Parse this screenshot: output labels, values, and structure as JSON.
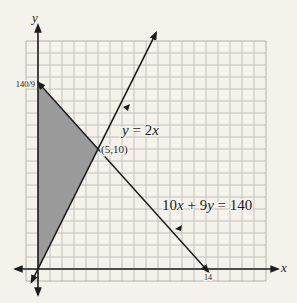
{
  "colors": {
    "background": "#f4f2ea",
    "grid": "#bcbcbc",
    "grid_border": "#a9a9a9",
    "axis": "#1c1c1c",
    "line": "#1c1c1c",
    "shade": "#9a9a9a"
  },
  "layout": {
    "origin_px": [
      38,
      269
    ],
    "unit_px": 12
  },
  "axes": {
    "x_label": "x",
    "y_label": "y"
  },
  "labels": {
    "y_intercept": "140/9",
    "intersection": "(5,10)",
    "x_intercept": "14",
    "line1": {
      "p1": "y",
      "p2": " = 2",
      "p3": "x"
    },
    "line2": {
      "p1": "10",
      "p2": "x",
      "p3": " + 9",
      "p4": "y",
      "p5": " = 140"
    }
  },
  "chart_data": {
    "type": "line",
    "title": "",
    "xlabel": "x",
    "ylabel": "y",
    "xlim": [
      -1,
      19
    ],
    "ylim": [
      -1,
      19
    ],
    "grid": true,
    "grid_step": 1,
    "legend": "none",
    "series": [
      {
        "name": "y = 2x",
        "equation": "y = 2x",
        "x": [
          -0.55,
          9.85
        ],
        "y": [
          -1.1,
          19.7
        ]
      },
      {
        "name": "10x + 9y = 140",
        "equation": "10x + 9y = 140",
        "x": [
          0,
          14.2
        ],
        "y": [
          15.556,
          -0.222
        ]
      }
    ],
    "shaded_region": {
      "description": "feasible region bounded by x = 0, y = 2x, 10x + 9y = 140",
      "vertices": [
        [
          0,
          0
        ],
        [
          0,
          15.556
        ],
        [
          5,
          10
        ]
      ]
    },
    "annotations": [
      {
        "text": "140/9",
        "x": 0,
        "y": 15.556,
        "type": "y-intercept"
      },
      {
        "text": "(5,10)",
        "x": 5,
        "y": 10,
        "type": "intersection"
      },
      {
        "text": "14",
        "x": 14,
        "y": 0,
        "type": "x-intercept"
      },
      {
        "text": "y = 2x",
        "type": "line-label"
      },
      {
        "text": "10x + 9y = 140",
        "type": "line-label"
      }
    ]
  }
}
